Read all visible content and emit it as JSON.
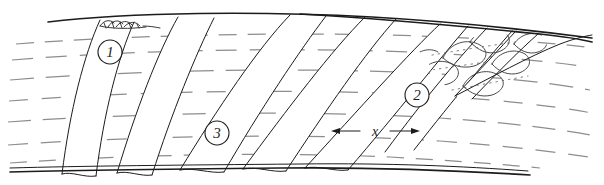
{
  "figure": {
    "kind": "hand-drawn-sketch-diagram",
    "width": 604,
    "height": 185,
    "background_color": "#ffffff",
    "ink_color": "#1c1c1c",
    "flowline_color": "#8d8d8d",
    "lobe_color": "#4a4a4a",
    "stipple_color": "#6e6e6e"
  },
  "callouts": [
    {
      "id": "callout-1",
      "label": "1",
      "cx": 110,
      "cy": 52,
      "r": 12
    },
    {
      "id": "callout-3",
      "label": "3",
      "cx": 217,
      "cy": 133,
      "r": 12
    },
    {
      "id": "callout-2",
      "label": "2",
      "cx": 417,
      "cy": 95,
      "r": 12
    }
  ],
  "dimension": {
    "id": "dimension-x",
    "label": "x",
    "label_x": 375,
    "label_y": 131,
    "left_x": 331,
    "right_x": 420,
    "y": 131
  },
  "bands": [
    {
      "name": "band-1",
      "top_x": 100,
      "bottom_x": 62
    },
    {
      "name": "band-2",
      "top_x": 178,
      "bottom_x": 117
    },
    {
      "name": "band-3",
      "top_x": 290,
      "bottom_x": 180
    },
    {
      "name": "band-4",
      "top_x": 365,
      "bottom_x": 243
    },
    {
      "name": "band-5",
      "top_x": 440,
      "bottom_x": 305
    },
    {
      "name": "band-6",
      "top_x": 487,
      "bottom_x": 385
    },
    {
      "name": "band-7",
      "top_x": 516,
      "bottom_x": 455
    }
  ],
  "detail_marks": {
    "vegetation_tuft": {
      "name": "vegetation-tuft",
      "x": 118,
      "y": 22
    },
    "scour_lobes_count": 7,
    "stipple_rows": 3
  },
  "flow_lines": {
    "name": "dashed-flow-lines",
    "row_count": 7,
    "style": "dashed"
  }
}
